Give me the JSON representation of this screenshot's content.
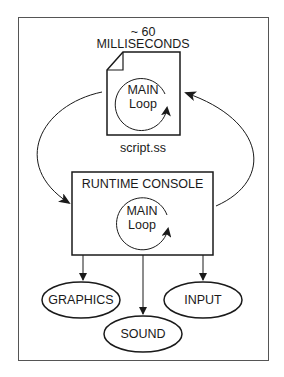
{
  "diagram": {
    "timing_line1": "~ 60",
    "timing_line2": "MILLISECONDS",
    "script_file": {
      "loop_line1": "MAIN",
      "loop_line2": "Loop",
      "filename": "script.ss"
    },
    "runtime_console": {
      "title": "RUNTIME CONSOLE",
      "loop_line1": "MAIN",
      "loop_line2": "Loop"
    },
    "outputs": [
      {
        "label": "GRAPHICS"
      },
      {
        "label": "SOUND"
      },
      {
        "label": "INPUT"
      }
    ],
    "colors": {
      "stroke": "#1a1a1a",
      "background": "#ffffff"
    }
  }
}
